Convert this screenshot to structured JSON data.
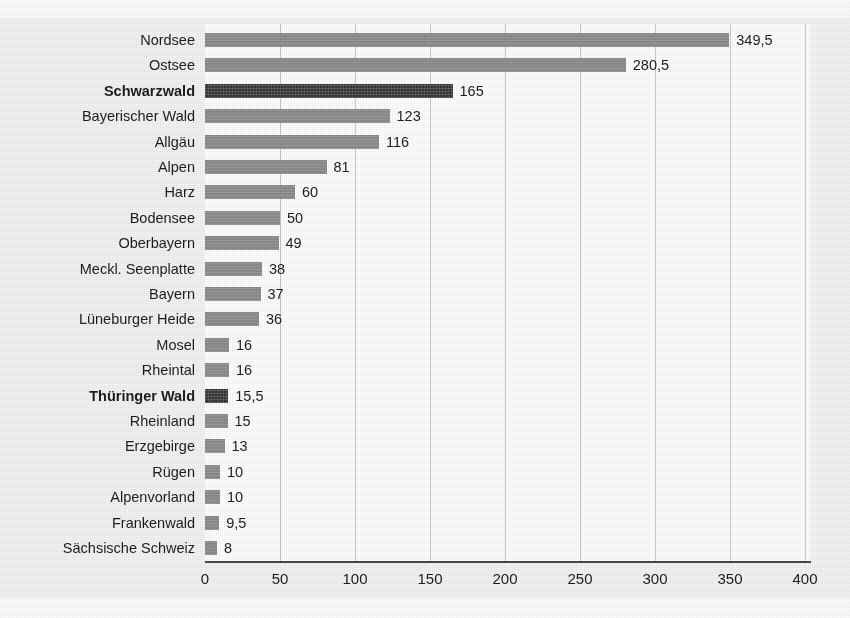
{
  "chart_data": {
    "type": "bar",
    "orientation": "horizontal",
    "title": "",
    "subtitle": "",
    "xlabel": "",
    "ylabel": "",
    "xlim": [
      0,
      400
    ],
    "xticks": [
      0,
      50,
      100,
      150,
      200,
      250,
      300,
      350,
      400
    ],
    "xtick_labels": [
      "0",
      "50",
      "100",
      "150",
      "200",
      "250",
      "300",
      "350",
      "400"
    ],
    "grid": "vertical",
    "legend": "none",
    "decimal_separator": ",",
    "colors": {
      "bar_normal": "#8c8c8c",
      "bar_highlight": "#353535",
      "gridline": "#c9c9c9",
      "axis": "#4a4a4a",
      "plot_background": "#ffffff",
      "figure_background": "#f4f4f4",
      "text": "#1d1d1d"
    },
    "categories": [
      "Nordsee",
      "Ostsee",
      "Schwarzwald",
      "Bayerischer Wald",
      "Allgäu",
      "Alpen",
      "Harz",
      "Bodensee",
      "Oberbayern",
      "Meckl. Seenplatte",
      "Bayern",
      "Lüneburger Heide",
      "Mosel",
      "Rheintal",
      "Thüringer Wald",
      "Rheinland",
      "Erzgebirge",
      "Rügen",
      "Alpenvorland",
      "Frankenwald",
      "Sächsische Schweiz"
    ],
    "values": [
      349.5,
      280.5,
      165,
      123,
      116,
      81,
      60,
      50,
      49,
      38,
      37,
      36,
      16,
      16,
      15.5,
      15,
      13,
      10,
      10,
      9.5,
      8
    ],
    "value_labels": [
      "349,5",
      "280,5",
      "165",
      "123",
      "116",
      "81",
      "60",
      "50",
      "49",
      "38",
      "37",
      "36",
      "16",
      "16",
      "15,5",
      "15",
      "13",
      "10",
      "10",
      "9,5",
      "8"
    ],
    "highlighted": [
      false,
      false,
      true,
      false,
      false,
      false,
      false,
      false,
      false,
      false,
      false,
      false,
      false,
      false,
      true,
      false,
      false,
      false,
      false,
      false,
      false
    ]
  }
}
